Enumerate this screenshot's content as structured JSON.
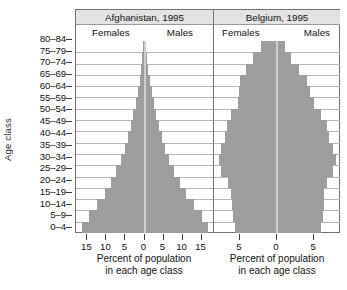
{
  "figure": {
    "y_axis_title": "Age class",
    "age_classes": [
      "80–84",
      "75–79",
      "70–74",
      "65–69",
      "60–64",
      "55–59",
      "50–54",
      "45–49",
      "40–44",
      "35–39",
      "30–34",
      "25–29",
      "20–24",
      "15–19",
      "10–14",
      "5–9",
      "0–4"
    ],
    "panels": [
      {
        "key": "afghanistan",
        "title": "Afghanistan, 1995",
        "female_label": "Females",
        "male_label": "Males",
        "x_caption_line1": "Percent of population",
        "x_caption_line2": "in each age class",
        "x_ticks": [
          15,
          10,
          5,
          0,
          5,
          10,
          15
        ],
        "x_tick_labels": [
          "15",
          "10",
          "5",
          "0",
          "5",
          "10",
          "15"
        ],
        "x_max": 18
      },
      {
        "key": "belgium",
        "title": "Belgium, 1995",
        "female_label": "Females",
        "male_label": "Males",
        "x_caption_line1": "Percent of population",
        "x_caption_line2": "in each age class",
        "x_ticks": [
          5,
          0,
          5
        ],
        "x_tick_labels": [
          "5",
          "0",
          "5"
        ],
        "x_max": 8.5
      }
    ]
  },
  "chart_data": {
    "type": "bar",
    "subtype": "population-pyramid",
    "title": "",
    "xlabel": "Percent of population in each age class",
    "ylabel": "Age class",
    "grid": true,
    "legend": "in-panel (Females left of centre, Males right of centre)",
    "bar_color": "#9d9d9d",
    "categories": [
      "80–84",
      "75–79",
      "70–74",
      "65–69",
      "60–64",
      "55–59",
      "50–54",
      "45–49",
      "40–44",
      "35–39",
      "30–34",
      "25–29",
      "20–24",
      "15–19",
      "10–14",
      "5–9",
      "0–4"
    ],
    "panels": [
      {
        "name": "Afghanistan, 1995",
        "xlim": [
          -18,
          18
        ],
        "xticks": [
          15,
          10,
          5,
          0,
          5,
          10,
          15
        ],
        "series": [
          {
            "name": "Females",
            "side": "left",
            "values": [
              0.4,
              0.6,
              0.9,
              1.3,
              1.8,
              2.3,
              2.9,
              3.6,
              4.3,
              5.2,
              6.2,
              7.4,
              8.8,
              10.5,
              12.5,
              14.6,
              16.3
            ]
          },
          {
            "name": "Males",
            "side": "right",
            "values": [
              0.4,
              0.6,
              0.9,
              1.4,
              1.9,
              2.4,
              3.0,
              3.7,
              4.5,
              5.4,
              6.5,
              7.7,
              9.2,
              11.0,
              13.0,
              15.0,
              16.8
            ]
          }
        ]
      },
      {
        "name": "Belgium, 1995",
        "xlim": [
          -8.5,
          8.5
        ],
        "xticks": [
          5,
          0,
          5
        ],
        "series": [
          {
            "name": "Females",
            "side": "left",
            "values": [
              2.2,
              3.2,
              4.2,
              5.0,
              5.1,
              5.3,
              6.2,
              6.8,
              7.0,
              7.5,
              7.8,
              7.5,
              6.6,
              6.2,
              6.1,
              6.0,
              5.7
            ]
          },
          {
            "name": "Males",
            "side": "right",
            "values": [
              1.1,
              1.9,
              3.0,
              4.0,
              4.5,
              5.0,
              6.0,
              6.7,
              7.0,
              7.6,
              7.9,
              7.6,
              6.7,
              6.4,
              6.3,
              6.2,
              5.9
            ]
          }
        ]
      }
    ]
  }
}
